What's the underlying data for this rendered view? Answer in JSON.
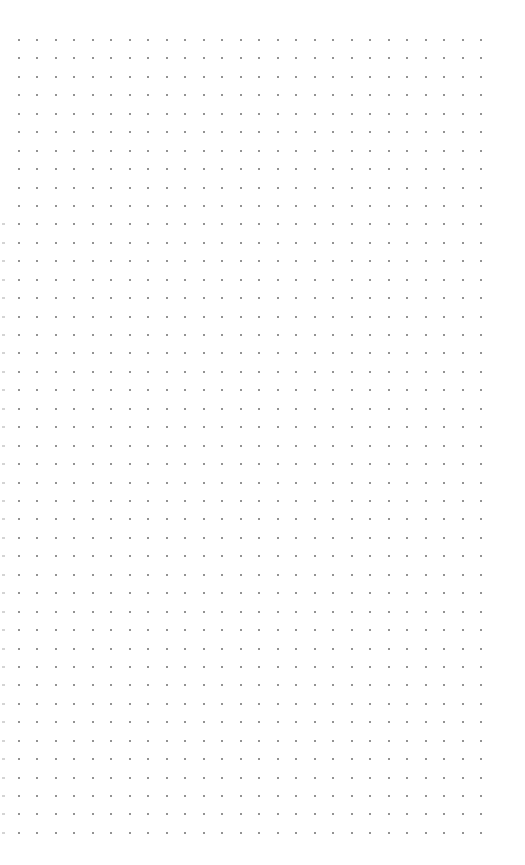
{
  "page": {
    "type": "dot-grid",
    "background_color": "#ffffff",
    "dot_color": "#6f6f6f",
    "edge_mark_color": "#d4d4d4"
  },
  "grid": {
    "columns": 26,
    "rows": 44,
    "origin_x": 19,
    "origin_y": 40,
    "spacing_x": 18.48,
    "spacing_y": 18.44,
    "edge_marks_start_row": 10,
    "edge_mark_x": 2
  }
}
